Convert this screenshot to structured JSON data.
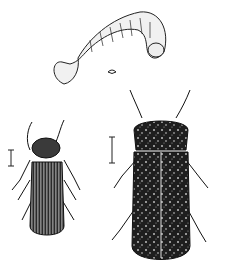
{
  "figure": {
    "background": "#ffffff",
    "ink": "#1a1a1a",
    "elements": [
      {
        "name": "larva",
        "label": ""
      },
      {
        "name": "small-beetle",
        "label": ""
      },
      {
        "name": "large-beetle",
        "label": ""
      },
      {
        "name": "scale-bar-left",
        "label": ""
      },
      {
        "name": "scale-bar-right",
        "label": ""
      }
    ]
  }
}
